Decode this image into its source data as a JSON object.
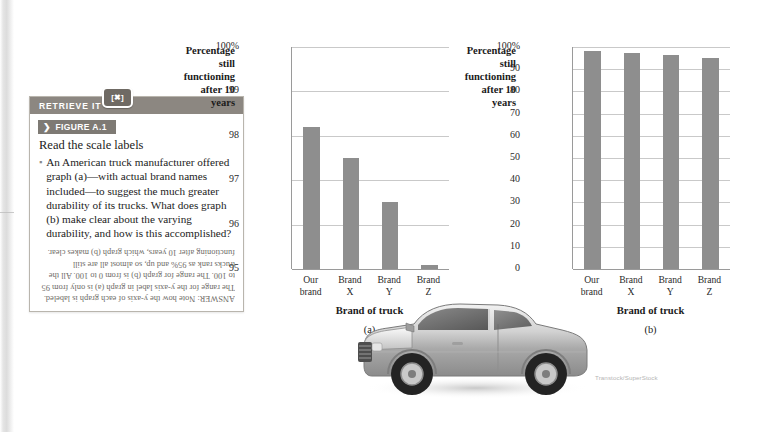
{
  "retrieve_box": {
    "header_label": "RETRIEVE IT",
    "badge_icon": "launchpad-icon",
    "badge_glyph": "[✖]",
    "figure_chevron": "❯",
    "figure_label": "FIGURE A.1",
    "title": "Read the scale labels",
    "bullet_glyph": "▪",
    "body": "An American truck manufacturer offered graph (a)—with actual brand names included—to suggest the much greater durability of its trucks. What does graph (b) make clear about the varying durability, and how is this accomplished?",
    "answer": "ANSWER: Note how the y-axis of each graph is labeled. The range for the y-axis label in graph (a) is only from 95 to 100. The range for graph (b) is from 0 to 100. All the trucks rank as 95% and up, so almost all are still functioning after 10 years, which graph (b) makes clear."
  },
  "photo_credit": "Transtock/SuperStock",
  "colors": {
    "bar": "#8e8e8e",
    "axis": "#9a9a9a",
    "grid": "#c9c9c9",
    "header_bar": "#8c8781",
    "tag": "#7e7a74"
  },
  "chart_data": [
    {
      "id": "graph-a",
      "type": "bar",
      "title": "",
      "panel_letter": "(a)",
      "ylabel": "Percentage still functioning after 10 years",
      "ylabel_lines": [
        "Percentage",
        "still functioning",
        "after 10 years"
      ],
      "xlabel": "Brand of truck",
      "categories": [
        "Our brand",
        "Brand X",
        "Brand Y",
        "Brand Z"
      ],
      "category_lines": [
        [
          "Our",
          "brand"
        ],
        [
          "Brand",
          "X"
        ],
        [
          "Brand",
          "Y"
        ],
        [
          "Brand",
          "Z"
        ]
      ],
      "values": [
        98.2,
        97.5,
        96.5,
        95.1
      ],
      "ylim": [
        95,
        100
      ],
      "yticks": [
        95,
        96,
        97,
        98,
        99,
        100
      ],
      "yticklabels": [
        "95",
        "96",
        "97",
        "98",
        "99",
        "100%"
      ],
      "grid": true,
      "legend": "none"
    },
    {
      "id": "graph-b",
      "type": "bar",
      "title": "",
      "panel_letter": "(b)",
      "ylabel": "Percentage still functioning after 10 years",
      "ylabel_lines": [
        "Percentage",
        "still functioning",
        "after 10 years"
      ],
      "xlabel": "Brand of truck",
      "categories": [
        "Our brand",
        "Brand X",
        "Brand Y",
        "Brand Z"
      ],
      "category_lines": [
        [
          "Our",
          "brand"
        ],
        [
          "Brand",
          "X"
        ],
        [
          "Brand",
          "Y"
        ],
        [
          "Brand",
          "Z"
        ]
      ],
      "values": [
        98.2,
        97.5,
        96.5,
        95.1
      ],
      "ylim": [
        0,
        100
      ],
      "yticks": [
        0,
        10,
        20,
        30,
        40,
        50,
        60,
        70,
        80,
        90,
        100
      ],
      "yticklabels": [
        "0",
        "10",
        "20",
        "30",
        "40",
        "50",
        "60",
        "70",
        "80",
        "90",
        "100%"
      ],
      "grid": true,
      "legend": "none"
    }
  ]
}
